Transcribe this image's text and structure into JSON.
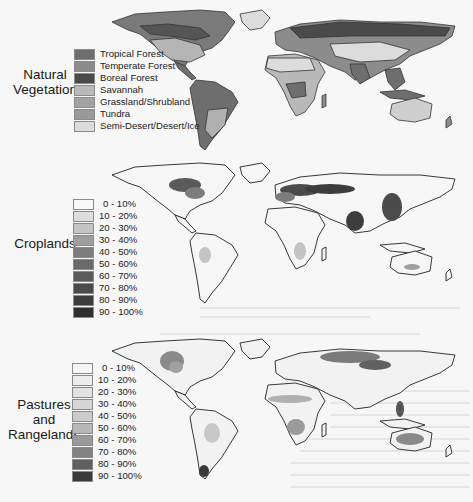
{
  "figure": {
    "panels": [
      {
        "id": "natural-vegetation",
        "title_lines": [
          "Natural",
          "Vegetation"
        ],
        "legend": [
          {
            "label": "Tropical Forest",
            "color": "#6e6e6e"
          },
          {
            "label": "Temperate Forest",
            "color": "#8c8c8c"
          },
          {
            "label": "Boreal Forest",
            "color": "#4a4a4a"
          },
          {
            "label": "Savannah",
            "color": "#b9b9b9"
          },
          {
            "label": "Grassland/Shrubland",
            "color": "#a3a3a3"
          },
          {
            "label": "Tundra",
            "color": "#9a9a9a"
          },
          {
            "label": "Semi-Desert/Desert/Ice",
            "color": "#dcdcdc"
          }
        ]
      },
      {
        "id": "croplands",
        "title_lines": [
          "Croplands"
        ],
        "legend": [
          {
            "label": "0 - 10%",
            "color": "#f8f8f8"
          },
          {
            "label": "10 - 20%",
            "color": "#dedede"
          },
          {
            "label": "20 - 30%",
            "color": "#c4c4c4"
          },
          {
            "label": "30 - 40%",
            "color": "#9e9e9e"
          },
          {
            "label": "40 - 50%",
            "color": "#7d7d7d"
          },
          {
            "label": "50 - 60%",
            "color": "#6a6a6a"
          },
          {
            "label": "60 - 70%",
            "color": "#5a5a5a"
          },
          {
            "label": "70 - 80%",
            "color": "#4b4b4b"
          },
          {
            "label": "80 - 90%",
            "color": "#3d3d3d"
          },
          {
            "label": "90 - 100%",
            "color": "#2f2f2f"
          }
        ]
      },
      {
        "id": "pastures-rangelands",
        "title_lines": [
          "Pastures",
          "and",
          "Rangelands"
        ],
        "legend": [
          {
            "label": "0 - 10%",
            "color": "#f6f6f6"
          },
          {
            "label": "10 - 20%",
            "color": "#ededed"
          },
          {
            "label": "20 - 30%",
            "color": "#e2e2e2"
          },
          {
            "label": "30 - 40%",
            "color": "#d6d6d6"
          },
          {
            "label": "40 - 50%",
            "color": "#cbcbcb"
          },
          {
            "label": "50 - 60%",
            "color": "#b8b8b8"
          },
          {
            "label": "60 - 70%",
            "color": "#9a9a9a"
          },
          {
            "label": "70 - 80%",
            "color": "#838383"
          },
          {
            "label": "80 - 90%",
            "color": "#606060"
          },
          {
            "label": "90 - 100%",
            "color": "#3a3a3a"
          }
        ]
      }
    ]
  }
}
